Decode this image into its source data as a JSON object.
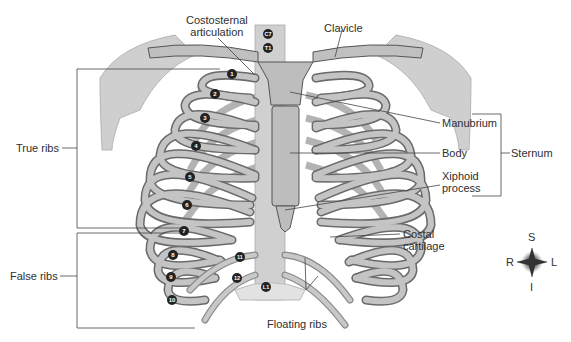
{
  "figure": {
    "labels": {
      "costosternal": [
        "Costosternal",
        "articulation"
      ],
      "clavicle": "Clavicle",
      "manubrium": "Manubrium",
      "body": "Body",
      "xiphoid": [
        "Xiphoid",
        "process"
      ],
      "sternum": "Sternum",
      "true_ribs": "True ribs",
      "false_ribs": "False ribs",
      "costal_cartilage": [
        "Costal",
        "cartilage"
      ],
      "floating_ribs": "Floating ribs"
    },
    "vertebra_markers": [
      "C7",
      "T1",
      "T11",
      "T12",
      "L1"
    ],
    "rib_numbers": [
      "1",
      "2",
      "3",
      "4",
      "5",
      "6",
      "7",
      "8",
      "9",
      "10",
      "11",
      "12"
    ],
    "compass": {
      "superior": "S",
      "inferior": "I",
      "right": "R",
      "left": "L"
    },
    "colors": {
      "bone": "#b8b8b8",
      "bone_dark": "#8c8c8c",
      "outline": "#555555",
      "background": "#ffffff"
    }
  }
}
